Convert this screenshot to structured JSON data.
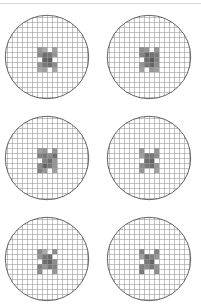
{
  "figure": {
    "layout": {
      "rows": 3,
      "cols": 2
    },
    "colors": {
      "background": "#ffffff",
      "circle_stroke": "#555555",
      "grid_line": "#9a9a9a",
      "top_rule": "#d6d6d6"
    },
    "grid_pitch_px": 5,
    "wafers": [
      {
        "id": "wafer-1",
        "row": 0,
        "col": 0,
        "cx": 47,
        "cy": 57,
        "pattern": [
          [
            0,
            0,
            0,
            0,
            0,
            0
          ],
          [
            0,
            150,
            170,
            0,
            160,
            0
          ],
          [
            0,
            140,
            110,
            120,
            150,
            0
          ],
          [
            0,
            0,
            100,
            95,
            0,
            0
          ],
          [
            0,
            150,
            120,
            110,
            140,
            0
          ],
          [
            0,
            170,
            160,
            0,
            165,
            0
          ]
        ]
      },
      {
        "id": "wafer-2",
        "row": 0,
        "col": 1,
        "cx": 149,
        "cy": 57,
        "pattern": [
          [
            0,
            0,
            0,
            0,
            0,
            0
          ],
          [
            0,
            140,
            150,
            0,
            150,
            0
          ],
          [
            0,
            130,
            100,
            115,
            120,
            0
          ],
          [
            0,
            0,
            110,
            90,
            130,
            0
          ],
          [
            0,
            150,
            120,
            100,
            140,
            0
          ],
          [
            0,
            160,
            0,
            150,
            160,
            0
          ]
        ]
      },
      {
        "id": "wafer-3",
        "row": 1,
        "col": 0,
        "cx": 47,
        "cy": 158,
        "pattern": [
          [
            0,
            0,
            0,
            0,
            0,
            0
          ],
          [
            0,
            160,
            150,
            0,
            150,
            0
          ],
          [
            0,
            130,
            120,
            140,
            110,
            0
          ],
          [
            0,
            0,
            130,
            110,
            150,
            0
          ],
          [
            0,
            140,
            100,
            120,
            150,
            0
          ],
          [
            0,
            130,
            150,
            0,
            160,
            0
          ]
        ]
      },
      {
        "id": "wafer-4",
        "row": 1,
        "col": 1,
        "cx": 149,
        "cy": 158,
        "pattern": [
          [
            0,
            0,
            0,
            0,
            0,
            0
          ],
          [
            0,
            150,
            0,
            0,
            150,
            0
          ],
          [
            0,
            160,
            120,
            120,
            140,
            0
          ],
          [
            0,
            0,
            110,
            100,
            0,
            0
          ],
          [
            0,
            140,
            120,
            110,
            150,
            0
          ],
          [
            0,
            150,
            0,
            0,
            160,
            0
          ]
        ]
      },
      {
        "id": "wafer-5",
        "row": 2,
        "col": 0,
        "cx": 47,
        "cy": 259,
        "pattern": [
          [
            0,
            0,
            0,
            0,
            0,
            0
          ],
          [
            0,
            140,
            170,
            0,
            140,
            0
          ],
          [
            0,
            150,
            120,
            110,
            0,
            0
          ],
          [
            0,
            0,
            110,
            100,
            140,
            0
          ],
          [
            0,
            130,
            150,
            120,
            130,
            0
          ],
          [
            0,
            140,
            0,
            0,
            150,
            0
          ]
        ]
      },
      {
        "id": "wafer-6",
        "row": 2,
        "col": 1,
        "cx": 149,
        "cy": 259,
        "pattern": [
          [
            0,
            0,
            0,
            0,
            0,
            0
          ],
          [
            0,
            130,
            0,
            0,
            130,
            0
          ],
          [
            0,
            160,
            110,
            130,
            150,
            0
          ],
          [
            0,
            0,
            120,
            100,
            0,
            0
          ],
          [
            0,
            130,
            140,
            120,
            150,
            0
          ],
          [
            0,
            120,
            0,
            0,
            140,
            0
          ]
        ]
      }
    ]
  }
}
